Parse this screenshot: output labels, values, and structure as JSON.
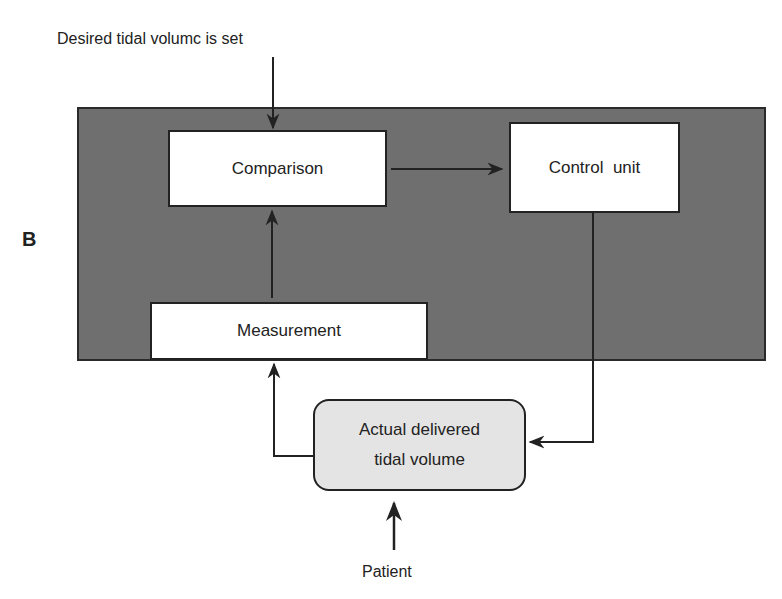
{
  "figure": {
    "panel_label": "B",
    "input_label": "Desired tidal volumc is set",
    "source_label": "Patient"
  },
  "nodes": {
    "comparison": "Comparison",
    "control_unit": "Control  unit",
    "measurement": "Measurement",
    "actual_volume_line1": "Actual delivered",
    "actual_volume_line2": "tidal volume"
  },
  "colors": {
    "panel_background": "#6f6f6f",
    "box_fill": "#ffffff",
    "rounded_box_fill": "#e4e4e4",
    "line": "#222222"
  },
  "edges": [
    {
      "from": "input",
      "to": "comparison"
    },
    {
      "from": "comparison",
      "to": "control_unit"
    },
    {
      "from": "control_unit",
      "to": "actual_volume"
    },
    {
      "from": "actual_volume",
      "to": "measurement"
    },
    {
      "from": "measurement",
      "to": "comparison"
    },
    {
      "from": "patient",
      "to": "actual_volume"
    }
  ]
}
